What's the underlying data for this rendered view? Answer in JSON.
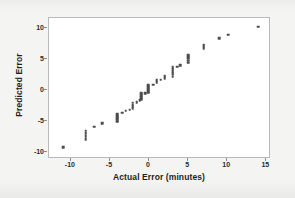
{
  "chart_data": {
    "type": "scatter",
    "title": "",
    "xlabel": "Actual Error (minutes)",
    "ylabel": "Predicted Error",
    "xlim": [
      -12.8,
      15.6
    ],
    "ylim": [
      -11.2,
      11.6
    ],
    "xticks": [
      -10,
      -5,
      0,
      5,
      10,
      15
    ],
    "xtick_labels": [
      "-10",
      "-5",
      "0",
      "5",
      "10",
      "15"
    ],
    "yticks": [
      -10,
      -5,
      0,
      5,
      10
    ],
    "ytick_labels": [
      "-10",
      "-5",
      "0",
      "5",
      "10"
    ],
    "grid": false,
    "legend": null,
    "marker_color": "#4c4c4c",
    "marker_size": 2.6,
    "plot_background": "#ffffff",
    "frame_color": "#b9b9b9",
    "page_background": "#f2f2f0",
    "series": [
      {
        "name": "Predicted vs Actual Error",
        "points": [
          [
            -11.0,
            -9.3
          ],
          [
            -8.1,
            -8.0
          ],
          [
            -8.1,
            -7.5
          ],
          [
            -8.1,
            -7.0
          ],
          [
            -8.1,
            -6.6
          ],
          [
            -7.0,
            -6.0
          ],
          [
            -6.0,
            -5.4
          ],
          [
            -4.1,
            -5.2
          ],
          [
            -4.1,
            -4.9
          ],
          [
            -4.1,
            -4.6
          ],
          [
            -4.1,
            -4.3
          ],
          [
            -4.1,
            -4.0
          ],
          [
            -3.4,
            -3.7
          ],
          [
            -3.0,
            -3.4
          ],
          [
            -2.5,
            -3.2
          ],
          [
            -2.1,
            -3.0
          ],
          [
            -2.1,
            -2.7
          ],
          [
            -2.1,
            -2.4
          ],
          [
            -2.1,
            -2.1
          ],
          [
            -1.6,
            -2.0
          ],
          [
            -1.2,
            -1.7
          ],
          [
            -1.0,
            -1.5
          ],
          [
            -1.0,
            -1.2
          ],
          [
            -1.0,
            -0.9
          ],
          [
            -1.0,
            -0.6
          ],
          [
            -0.5,
            -0.6
          ],
          [
            -0.1,
            -0.5
          ],
          [
            -0.1,
            -0.2
          ],
          [
            -0.1,
            0.1
          ],
          [
            -0.1,
            0.4
          ],
          [
            -0.1,
            0.7
          ],
          [
            0.5,
            0.8
          ],
          [
            1.0,
            1.2
          ],
          [
            1.0,
            1.5
          ],
          [
            1.5,
            1.6
          ],
          [
            2.0,
            1.9
          ],
          [
            2.0,
            2.2
          ],
          [
            3.0,
            2.1
          ],
          [
            3.0,
            2.4
          ],
          [
            3.0,
            2.7
          ],
          [
            3.0,
            3.0
          ],
          [
            3.0,
            3.3
          ],
          [
            3.0,
            3.6
          ],
          [
            3.6,
            3.7
          ],
          [
            4.0,
            4.0
          ],
          [
            5.0,
            4.4
          ],
          [
            5.0,
            4.7
          ],
          [
            5.0,
            5.0
          ],
          [
            5.0,
            5.3
          ],
          [
            5.0,
            5.6
          ],
          [
            7.0,
            6.7
          ],
          [
            7.0,
            7.0
          ],
          [
            7.0,
            7.3
          ],
          [
            9.0,
            8.3
          ],
          [
            10.1,
            8.9
          ],
          [
            14.0,
            10.2
          ]
        ]
      }
    ]
  },
  "axes": {
    "x_title": "Actual Error (minutes)",
    "y_title": "Predicted Error"
  }
}
